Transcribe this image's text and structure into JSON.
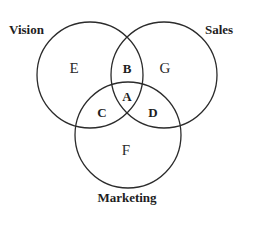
{
  "diagram": {
    "type": "venn-3",
    "sets": [
      {
        "id": "vision",
        "label": "Vision",
        "cx": 90,
        "cy": 75,
        "r": 53
      },
      {
        "id": "sales",
        "label": "Sales",
        "cx": 164,
        "cy": 75,
        "r": 53
      },
      {
        "id": "marketing",
        "label": "Marketing",
        "cx": 128,
        "cy": 135,
        "r": 53
      }
    ],
    "regions": {
      "A": {
        "label": "A",
        "description": "Vision ∩ Sales ∩ Marketing",
        "bold": true
      },
      "B": {
        "label": "B",
        "description": "Vision ∩ Sales only",
        "bold": true
      },
      "C": {
        "label": "C",
        "description": "Vision ∩ Marketing only",
        "bold": true
      },
      "D": {
        "label": "D",
        "description": "Sales ∩ Marketing only",
        "bold": true
      },
      "E": {
        "label": "E",
        "description": "Vision only",
        "bold": false
      },
      "F": {
        "label": "F",
        "description": "Marketing only",
        "bold": false
      },
      "G": {
        "label": "G",
        "description": "Sales only",
        "bold": false
      }
    },
    "colors": {
      "stroke": "#2b2b2b",
      "text": "#1e1e1e",
      "background": "#ffffff"
    }
  }
}
